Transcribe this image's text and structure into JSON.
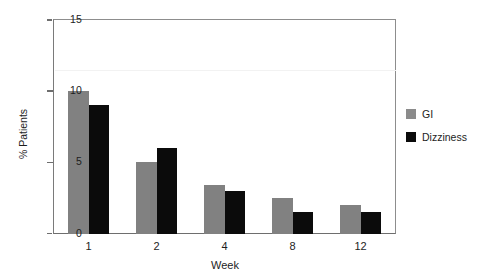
{
  "chart_data": {
    "type": "bar",
    "title": "",
    "subtitle": "",
    "xlabel": "Week",
    "ylabel": "% Patients",
    "categories": [
      "1",
      "2",
      "4",
      "8",
      "12"
    ],
    "series": [
      {
        "name": "GI",
        "color": "#818181",
        "values": [
          10.0,
          5.0,
          3.4,
          2.5,
          2.0
        ]
      },
      {
        "name": "Dizziness",
        "color": "#0b0b0b",
        "values": [
          9.0,
          6.0,
          3.0,
          1.5,
          1.5
        ]
      }
    ],
    "ylim": [
      0,
      15
    ],
    "yticks": [
      "0",
      "5",
      "10",
      "15"
    ],
    "ytick_values": [
      0,
      5,
      10,
      15
    ],
    "xticks": [
      "1",
      "2",
      "4",
      "8",
      "12"
    ],
    "grid": false,
    "legend_position": "right"
  },
  "legend": {
    "items": [
      {
        "label": "GI"
      },
      {
        "label": "Dizziness"
      }
    ]
  },
  "axes": {
    "y_label": "% Patients",
    "x_label": "Week",
    "y_tick_labels": [
      "0",
      "5",
      "10",
      "15"
    ],
    "x_tick_labels": [
      "1",
      "2",
      "4",
      "8",
      "12"
    ]
  },
  "colors": {
    "series_gi": "#818181",
    "series_dizziness": "#0b0b0b",
    "axis": "#6e6e6e",
    "text": "#1d1d1d",
    "background": "#ffffff"
  }
}
